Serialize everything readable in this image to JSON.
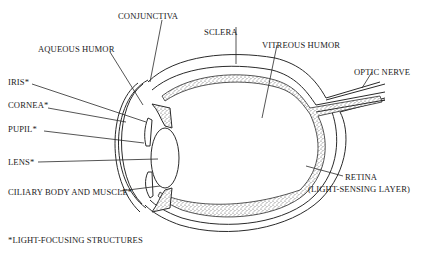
{
  "diagram": {
    "labels": {
      "conjunctiva": "CONJUNCTIVA",
      "sclera": "SCLERA",
      "aqueous_humor": "AQUEOUS HUMOR",
      "vitreous_humor": "VITREOUS HUMOR",
      "optic_nerve": "OPTIC NERVE",
      "iris": "IRIS*",
      "cornea": "CORNEA*",
      "pupil": "PUPIL*",
      "lens": "LENS*",
      "ciliary": "CILIARY BODY AND MUSCLE*",
      "retina": "RETINA",
      "retina_sub": "(LIGHT-SENSING LAYER)"
    },
    "footnote": "*LIGHT-FOCUSING STRUCTURES",
    "colors": {
      "line": "#2a2a2a",
      "text": "#222222",
      "background": "#ffffff"
    }
  }
}
